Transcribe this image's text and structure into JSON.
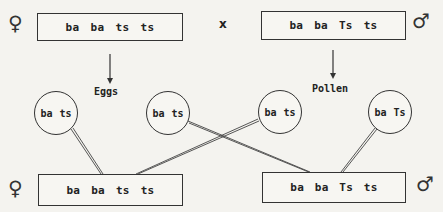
{
  "parents": {
    "female": {
      "symbol": "♀",
      "alleles": [
        "ba",
        "ba",
        "ts",
        "ts"
      ]
    },
    "cross_symbol": "x",
    "male": {
      "symbol": "♂",
      "alleles": [
        "ba",
        "ba",
        "Ts",
        "ts"
      ]
    }
  },
  "labels": {
    "eggs": "Eggs",
    "pollen": "Pollen"
  },
  "gametes": [
    {
      "source": "eggs",
      "alleles": [
        "ba",
        "ts"
      ]
    },
    {
      "source": "eggs",
      "alleles": [
        "ba",
        "ts"
      ]
    },
    {
      "source": "pollen",
      "alleles": [
        "ba",
        "ts"
      ]
    },
    {
      "source": "pollen",
      "alleles": [
        "ba",
        "Ts"
      ]
    }
  ],
  "offspring": {
    "female": {
      "symbol": "♀",
      "alleles": [
        "ba",
        "ba",
        "ts",
        "ts"
      ]
    },
    "male": {
      "symbol": "♂",
      "alleles": [
        "ba",
        "ba",
        "Ts",
        "ts"
      ]
    }
  },
  "colors": {
    "ink": "#333333",
    "paper": "#f4f3ef"
  }
}
